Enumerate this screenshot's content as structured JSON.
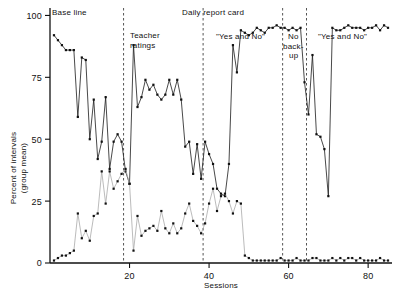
{
  "chart_data": {
    "type": "line",
    "title": "",
    "xlabel": "Sessions",
    "ylabel": "Percent of intervals\n(group mean)",
    "ylabel_line1": "Percent of intervals",
    "ylabel_line2": "(group mean)",
    "xlim": [
      0,
      86
    ],
    "ylim": [
      0,
      103
    ],
    "xticks": [
      20,
      40,
      60,
      80
    ],
    "yticks": [
      0,
      25,
      50,
      75,
      100
    ],
    "grid": false,
    "legend": "none",
    "x": [
      1,
      2,
      3,
      4,
      5,
      6,
      7,
      8,
      9,
      10,
      11,
      12,
      13,
      14,
      15,
      16,
      17,
      18,
      19,
      20,
      21,
      22,
      23,
      24,
      25,
      26,
      27,
      28,
      29,
      30,
      31,
      32,
      33,
      34,
      35,
      36,
      37,
      38,
      39,
      40,
      41,
      42,
      43,
      44,
      45,
      46,
      47,
      48,
      49,
      50,
      51,
      52,
      53,
      54,
      55,
      56,
      57,
      58,
      59,
      60,
      61,
      62,
      63,
      64,
      65,
      66,
      67,
      68,
      69,
      70,
      71,
      72,
      73,
      74,
      75,
      76,
      77,
      78,
      79,
      80,
      81,
      82,
      83,
      84,
      85
    ],
    "series": [
      {
        "name": "upper-series",
        "color": "#1a1a1a",
        "marker": "square",
        "values": [
          92,
          90,
          88,
          86,
          86,
          86,
          59,
          83,
          82,
          50,
          66,
          42,
          49,
          67,
          38,
          49,
          52,
          49,
          37,
          32,
          88,
          63,
          67,
          74,
          70,
          72,
          68,
          66,
          68,
          74,
          68,
          74,
          66,
          47,
          49,
          36,
          48,
          34,
          49,
          44,
          40,
          30,
          28,
          27,
          40,
          88,
          77,
          94,
          93,
          92,
          93,
          95,
          94,
          93,
          95,
          95,
          96,
          95,
          95,
          94,
          95,
          94,
          95,
          73,
          60,
          84,
          52,
          51,
          46,
          27,
          95,
          94,
          94,
          95,
          96,
          95,
          95,
          95,
          94,
          95,
          95,
          96,
          94,
          96,
          95
        ]
      },
      {
        "name": "lower-series",
        "color": "#aaaaaa",
        "marker": "square",
        "values": [
          1,
          2,
          3,
          3,
          4,
          5,
          20,
          10,
          13,
          9,
          19,
          20,
          37,
          24,
          37,
          30,
          33,
          36,
          38,
          32,
          5,
          19,
          11,
          13,
          14,
          15,
          13,
          21,
          14,
          12,
          16,
          12,
          14,
          20,
          24,
          17,
          15,
          12,
          16,
          24,
          30,
          21,
          27,
          28,
          25,
          20,
          25,
          24,
          3,
          2,
          1,
          1,
          1,
          1,
          1,
          1,
          1,
          2,
          1,
          1,
          1,
          2,
          1,
          1,
          1,
          2,
          2,
          1,
          1,
          1,
          2,
          1,
          2,
          1,
          2,
          2,
          1,
          2,
          1,
          1,
          1,
          1,
          2,
          1,
          1
        ]
      }
    ],
    "phase_dividers": [
      18.5,
      38.5,
      58.5,
      64.5
    ],
    "phase_labels": [
      {
        "id": "baseline",
        "text": "Base line",
        "x_px": 52,
        "y_px": 15
      },
      {
        "id": "daily-report-card",
        "text": "Daily report card",
        "x_px": 182,
        "y_px": 15
      },
      {
        "id": "teacher-ratings-line1",
        "text": "Teacher",
        "x_px": 130,
        "y_px": 38
      },
      {
        "id": "teacher-ratings-line2",
        "text": "ratings",
        "x_px": 130,
        "y_px": 48
      },
      {
        "id": "yes-and-no-first",
        "text": "\"Yes and No\"",
        "x_px": 216,
        "y_px": 39
      },
      {
        "id": "no-backup-line1",
        "text": "No",
        "x_px": 288,
        "y_px": 39
      },
      {
        "id": "no-backup-line2",
        "text": "back-",
        "x_px": 283,
        "y_px": 49
      },
      {
        "id": "no-backup-line3",
        "text": "up",
        "x_px": 289,
        "y_px": 58
      },
      {
        "id": "yes-and-no-second",
        "text": "\"Yes and No\"",
        "x_px": 318,
        "y_px": 39
      }
    ]
  },
  "axes": {
    "x_axis_label": "Sessions",
    "y_axis_label_line1": "Percent of intervals",
    "y_axis_label_line2": "(group mean)",
    "x_tick_labels": [
      "20",
      "40",
      "60",
      "80"
    ],
    "y_tick_labels": [
      "0",
      "25",
      "50",
      "75",
      "100"
    ]
  },
  "colors": {
    "upper_series": "#1a1a1a",
    "lower_series": "#aaaaaa",
    "axis": "#111111",
    "divider": "#555555",
    "background": "#ffffff"
  }
}
